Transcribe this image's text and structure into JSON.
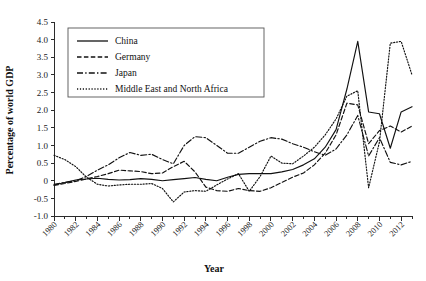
{
  "chart_data": {
    "type": "line",
    "title": "",
    "xlabel": "Year",
    "ylabel": "Percentage of world GDP",
    "xlim": [
      1980,
      2013
    ],
    "ylim": [
      -1.0,
      4.5
    ],
    "grid": false,
    "legend_position": "top-left-inside",
    "x": [
      1980,
      1981,
      1982,
      1983,
      1984,
      1985,
      1986,
      1987,
      1988,
      1989,
      1990,
      1991,
      1992,
      1993,
      1994,
      1995,
      1996,
      1997,
      1998,
      1999,
      2000,
      2001,
      2002,
      2003,
      2004,
      2005,
      2006,
      2007,
      2008,
      2009,
      2010,
      2011,
      2012,
      2013
    ],
    "xticks": [
      1980,
      1982,
      1984,
      1986,
      1988,
      1990,
      1992,
      1994,
      1996,
      1998,
      2000,
      2002,
      2004,
      2006,
      2008,
      2010,
      2012
    ],
    "xticklabels": [
      "1980",
      "1982",
      "1984",
      "1986",
      "1988",
      "1990",
      "1992",
      "1994",
      "1996",
      "1998",
      "2000",
      "2002",
      "2004",
      "2006",
      "2008",
      "2010",
      "2012"
    ],
    "yticks": [
      -1.0,
      -0.5,
      0,
      0.5,
      1.0,
      1.5,
      2.0,
      2.5,
      3.0,
      3.5,
      4.0,
      4.5
    ],
    "yticklabels": [
      "-1.0",
      "-0.5",
      "0",
      "0.5",
      "1.0",
      "1.5",
      "2.0",
      "2.5",
      "3.0",
      "3.5",
      "4.0",
      "4.5"
    ],
    "series": [
      {
        "name": "China",
        "dash": "solid",
        "values": [
          -0.12,
          -0.05,
          0.02,
          0.05,
          0.07,
          0.04,
          0.02,
          0.03,
          0.06,
          0.04,
          0.0,
          0.03,
          0.06,
          0.09,
          0.04,
          0.0,
          0.1,
          0.18,
          0.2,
          0.2,
          0.2,
          0.25,
          0.32,
          0.45,
          0.62,
          0.95,
          1.45,
          2.6,
          3.95,
          1.95,
          1.9,
          0.92,
          1.95,
          2.1
        ]
      },
      {
        "name": "Germany",
        "dash": "dashed",
        "values": [
          -0.13,
          -0.08,
          -0.02,
          0.05,
          0.12,
          0.2,
          0.3,
          0.28,
          0.26,
          0.2,
          0.22,
          0.4,
          0.55,
          0.25,
          -0.18,
          -0.28,
          -0.3,
          -0.22,
          -0.28,
          -0.3,
          -0.2,
          -0.05,
          0.1,
          0.22,
          0.45,
          0.78,
          1.3,
          2.2,
          2.15,
          1.05,
          1.42,
          1.55,
          1.38,
          1.55
        ]
      },
      {
        "name": "Japan",
        "dash": "dashdot",
        "values": [
          -0.1,
          -0.05,
          0.0,
          0.12,
          0.3,
          0.45,
          0.65,
          0.8,
          0.72,
          0.75,
          0.6,
          0.48,
          1.0,
          1.25,
          1.22,
          1.0,
          0.78,
          0.78,
          0.95,
          1.12,
          1.22,
          1.18,
          1.05,
          0.95,
          0.82,
          0.72,
          0.9,
          1.3,
          1.85,
          0.7,
          1.22,
          0.52,
          0.45,
          0.55
        ]
      },
      {
        "name": "Middle East and North Africa",
        "dash": "dotted",
        "values": [
          0.72,
          0.6,
          0.4,
          0.1,
          -0.1,
          -0.15,
          -0.12,
          -0.1,
          -0.1,
          -0.08,
          -0.22,
          -0.6,
          -0.32,
          -0.28,
          -0.3,
          -0.12,
          0.05,
          0.2,
          -0.3,
          0.12,
          0.7,
          0.5,
          0.48,
          0.7,
          0.95,
          1.3,
          1.75,
          2.4,
          2.55,
          -0.2,
          1.1,
          3.9,
          3.95,
          3.0
        ]
      }
    ]
  },
  "legend": {
    "items": [
      {
        "label": "China",
        "dash": "solid"
      },
      {
        "label": "Germany",
        "dash": "dashed"
      },
      {
        "label": "Japan",
        "dash": "dashdot"
      },
      {
        "label": "Middle East and North Africa",
        "dash": "dotted"
      }
    ]
  },
  "axes": {
    "y_title": "Percentage of world GDP",
    "x_title": "Year"
  }
}
